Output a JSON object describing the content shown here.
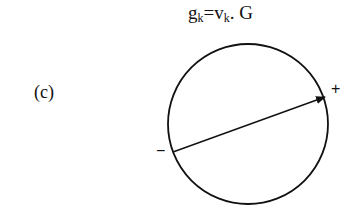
{
  "equation": {
    "g": "g",
    "g_sub": "k",
    "eq": "=",
    "v": "v",
    "v_sub": "k",
    "rest": ". G"
  },
  "panel_label": "(c)",
  "signs": {
    "plus": "+",
    "minus": "−"
  },
  "diagram": {
    "circle": {
      "cx": 248,
      "cy": 124,
      "r": 80
    },
    "arrow": {
      "x1": 173,
      "y1": 152,
      "x2": 325,
      "y2": 97
    },
    "stroke_color": "#111111"
  }
}
